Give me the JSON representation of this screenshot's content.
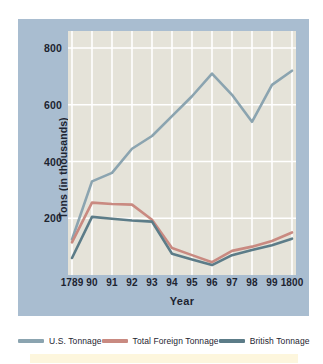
{
  "chart_data": {
    "type": "line",
    "title": "",
    "xlabel": "Year",
    "ylabel": "Tons (in thousands)",
    "x": [
      1789,
      1790,
      1791,
      1792,
      1793,
      1794,
      1795,
      1796,
      1797,
      1798,
      1799,
      1800
    ],
    "categories": [
      "1789",
      "90",
      "91",
      "92",
      "93",
      "94",
      "95",
      "96",
      "97",
      "98",
      "99",
      "1800"
    ],
    "xtick_labels": [
      "1789",
      "90",
      "91",
      "92",
      "93",
      "94",
      "95",
      "96",
      "97",
      "98",
      "99",
      "1800"
    ],
    "ytick_labels": [
      "200",
      "400",
      "600",
      "800"
    ],
    "yticks": [
      200,
      400,
      600,
      800
    ],
    "ylim": [
      0,
      860
    ],
    "grid": "vertical-and-horizontal-white",
    "legend_position": "below-plot",
    "series": [
      {
        "name": "U.S. Tonnage",
        "color": "#8ba4b0",
        "values": [
          125,
          330,
          360,
          445,
          490,
          560,
          630,
          710,
          635,
          540,
          670,
          720
        ]
      },
      {
        "name": "Total Foreign Tonnage",
        "color": "#c98a81",
        "values": [
          115,
          255,
          250,
          248,
          195,
          95,
          70,
          45,
          85,
          100,
          120,
          150
        ]
      },
      {
        "name": "British Tonnage",
        "color": "#5c7c88",
        "values": [
          60,
          205,
          198,
          192,
          188,
          75,
          55,
          35,
          70,
          88,
          105,
          128
        ]
      }
    ]
  },
  "legend": {
    "items": [
      {
        "label": "U.S. Tonnage",
        "color": "#8ba4b0"
      },
      {
        "label": "Total Foreign Tonnage",
        "color": "#c98a81"
      },
      {
        "label": "British Tonnage",
        "color": "#5c7c88"
      }
    ]
  },
  "axes": {
    "y_title": "Tons (in thousands)",
    "x_title": "Year"
  },
  "colors": {
    "panel_background": "#a9bdd0",
    "plot_background": "#e5e3d9",
    "gridline": "#ffffff",
    "text": "#1d2430",
    "bottom_band": "#fdf6dd"
  }
}
